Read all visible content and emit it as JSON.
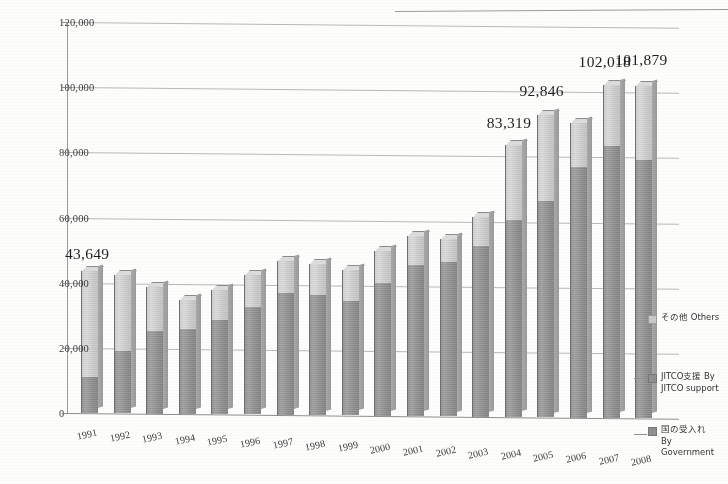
{
  "chart_data": {
    "type": "bar",
    "subtype": "stacked-column-3d",
    "title": "",
    "xlabel": "",
    "ylabel": "",
    "ylim": [
      0,
      120000
    ],
    "ytick_step": 20000,
    "ytick_labels": [
      "120,000",
      "100,000",
      "80,000",
      "60,000",
      "40,000",
      "20,000",
      "0"
    ],
    "ytick_values": [
      120000,
      100000,
      80000,
      60000,
      40000,
      20000,
      0
    ],
    "grid": true,
    "legend_position": "right",
    "categories": [
      "1991",
      "1992",
      "1993",
      "1994",
      "1995",
      "1996",
      "1997",
      "1998",
      "1999",
      "2000",
      "2001",
      "2002",
      "2003",
      "2004",
      "2005",
      "2006",
      "2007",
      "2008"
    ],
    "series": [
      {
        "name": "国の受入れ By Government",
        "key": "government",
        "color": "#8d8d8d",
        "values": [
          11000,
          19200,
          25500,
          26000,
          29000,
          33000,
          37500,
          36800,
          35200,
          40800,
          46300,
          47500,
          52300,
          60500,
          66500,
          77000,
          83500,
          79200
        ]
      },
      {
        "name": "JITCO支援 By JITCO support",
        "key": "jitco_support",
        "color": "#9b9b9b",
        "values": [
          0,
          0,
          0,
          0,
          0,
          0,
          0,
          0,
          0,
          0,
          0,
          0,
          0,
          0,
          0,
          0,
          0,
          0
        ]
      },
      {
        "name": "その他 Others",
        "key": "others",
        "color": "#c9c9c9",
        "values": [
          32649,
          23300,
          13500,
          9000,
          9200,
          9800,
          9600,
          9700,
          9300,
          9700,
          8800,
          7000,
          9000,
          22819,
          26346,
          13500,
          18518,
          22679
        ]
      }
    ],
    "totals": [
      43649,
      42500,
      39000,
      35000,
      38200,
      42800,
      47100,
      46500,
      44500,
      50500,
      55100,
      54500,
      61300,
      83319,
      92846,
      90500,
      102018,
      101879
    ],
    "data_labels": [
      {
        "category": "1991",
        "value": 43649,
        "text": "43,649"
      },
      {
        "category": "2004",
        "value": 83319,
        "text": "83,319"
      },
      {
        "category": "2005",
        "value": 92846,
        "text": "92,846"
      },
      {
        "category": "2007",
        "value": 102018,
        "text": "102,018"
      },
      {
        "category": "2008",
        "value": 101879,
        "text": "101,879"
      }
    ]
  },
  "legend": {
    "items": [
      {
        "label": "その他 Others",
        "swatch": "others"
      },
      {
        "label": "JITCO支援 By\nJITCO support",
        "swatch": "jitco"
      },
      {
        "label": "国の受入れ\nBy\nGovernment",
        "swatch": "gov"
      }
    ]
  }
}
